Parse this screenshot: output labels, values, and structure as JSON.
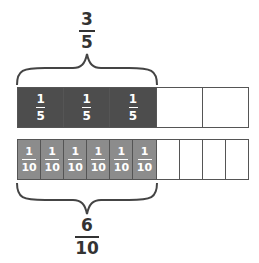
{
  "top_label": {
    "numerator": "3",
    "denominator": "5"
  },
  "bottom_label": {
    "numerator": "6",
    "denominator": "10"
  },
  "fifths_strip": {
    "cells": [
      {
        "numerator": "1",
        "denominator": "5",
        "shaded": true
      },
      {
        "numerator": "1",
        "denominator": "5",
        "shaded": true
      },
      {
        "numerator": "1",
        "denominator": "5",
        "shaded": true
      },
      {
        "numerator": "",
        "denominator": "",
        "shaded": false
      },
      {
        "numerator": "",
        "denominator": "",
        "shaded": false
      }
    ]
  },
  "tenths_strip": {
    "cells": [
      {
        "numerator": "1",
        "denominator": "10",
        "shaded": true
      },
      {
        "numerator": "1",
        "denominator": "10",
        "shaded": true
      },
      {
        "numerator": "1",
        "denominator": "10",
        "shaded": true
      },
      {
        "numerator": "1",
        "denominator": "10",
        "shaded": true
      },
      {
        "numerator": "1",
        "denominator": "10",
        "shaded": true
      },
      {
        "numerator": "1",
        "denominator": "10",
        "shaded": true
      },
      {
        "numerator": "",
        "denominator": "",
        "shaded": false
      },
      {
        "numerator": "",
        "denominator": "",
        "shaded": false
      },
      {
        "numerator": "",
        "denominator": "",
        "shaded": false
      },
      {
        "numerator": "",
        "denominator": "",
        "shaded": false
      }
    ]
  },
  "colors": {
    "dark_shade": "#4d4d4d",
    "light_shade": "#8c8c8c",
    "outline": "#555555"
  }
}
